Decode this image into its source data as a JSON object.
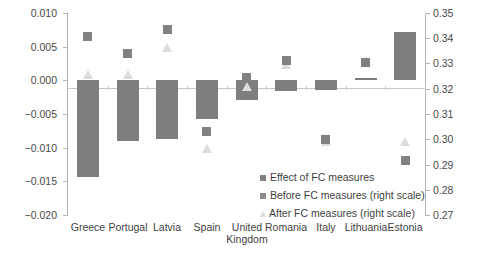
{
  "chart_data": {
    "type": "bar",
    "title": "",
    "subtitle": "",
    "xlabel": "",
    "ylabel": "",
    "categories": [
      "Greece",
      "Portugal",
      "Latvia",
      "Spain",
      "United\nKingdom",
      "Romania",
      "Italy",
      "Lithuania",
      "Estonia"
    ],
    "left_axis": {
      "label": "",
      "ylim": [
        -0.02,
        0.01
      ],
      "ticks": [
        0.01,
        0.005,
        0.0,
        -0.005,
        -0.01,
        -0.015,
        -0.02
      ],
      "tick_labels": [
        "0.010",
        "0.005",
        "0.000",
        "−0.005",
        "−0.010",
        "−0.015",
        "−0.020"
      ]
    },
    "right_axis": {
      "label": "",
      "ylim": [
        0.27,
        0.35
      ],
      "ticks": [
        0.35,
        0.34,
        0.33,
        0.32,
        0.31,
        0.3,
        0.29,
        0.28,
        0.27
      ],
      "tick_labels": [
        "0.35",
        "0.34",
        "0.33",
        "0.32",
        "0.31",
        "0.30",
        "0.29",
        "0.28",
        "0.27"
      ]
    },
    "grid": false,
    "legend_position": "inside-bottom-right",
    "series": [
      {
        "name": "Effect of FC measures",
        "type": "bar",
        "axis": "left",
        "color": "#7e7e7e",
        "values": [
          -0.0144,
          -0.0091,
          -0.0088,
          -0.0058,
          -0.0029,
          -0.0017,
          -0.0015,
          0.0003,
          0.0072
        ]
      },
      {
        "name": "Before FC measures (right scale)",
        "type": "scatter-square",
        "axis": "right",
        "color": "#818181",
        "values": [
          0.3405,
          0.334,
          0.3433,
          0.303,
          0.3245,
          0.3312,
          0.3,
          0.3305,
          0.2915
        ]
      },
      {
        "name": "After FC measures (right scale)",
        "type": "scatter-triangle",
        "axis": "right",
        "color": "#dcdcdc",
        "values": [
          0.3255,
          0.3255,
          0.336,
          0.296,
          0.3205,
          0.3295,
          0.299,
          0.331,
          0.299
        ]
      }
    ]
  },
  "legend": {
    "items": [
      {
        "label": "Effect of FC measures",
        "marker": "square"
      },
      {
        "label": "Before FC measures (right scale)",
        "marker": "square"
      },
      {
        "label": "After FC measures (right scale)",
        "marker": "triangle"
      }
    ]
  }
}
